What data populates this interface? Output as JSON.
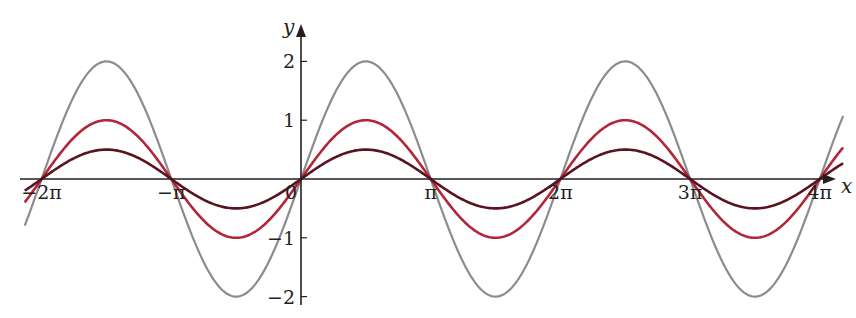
{
  "chart_data": {
    "type": "line",
    "title": "",
    "xlabel": "x",
    "ylabel": "y",
    "xlim_pi": [
      -2.13,
      4.18
    ],
    "ylim": [
      -2.2,
      2.5
    ],
    "grid": false,
    "legend": null,
    "x_ticks": [
      {
        "value_pi": -2,
        "label": "−2π"
      },
      {
        "value_pi": -1,
        "label": "−π"
      },
      {
        "value_pi": 0,
        "label": "0"
      },
      {
        "value_pi": 1,
        "label": "π"
      },
      {
        "value_pi": 2,
        "label": "2π"
      },
      {
        "value_pi": 3,
        "label": "3π"
      },
      {
        "value_pi": 4,
        "label": "4π"
      }
    ],
    "y_ticks": [
      {
        "value": 2,
        "label": "2"
      },
      {
        "value": 1,
        "label": "1"
      },
      {
        "value": -1,
        "label": "−1"
      },
      {
        "value": -2,
        "label": "−2"
      }
    ],
    "series": [
      {
        "name": "y = 2 sin x",
        "amplitude": 2,
        "color": "#8c8c8c",
        "width": 2.2
      },
      {
        "name": "y = sin x",
        "amplitude": 1,
        "color": "#b3263a",
        "width": 2.6
      },
      {
        "name": "y = 0.5 sin x",
        "amplitude": 0.5,
        "color": "#5a1420",
        "width": 2.6
      }
    ],
    "sample_points": {
      "x_pi": [
        -2,
        -1.5,
        -1,
        -0.5,
        0,
        0.5,
        1,
        1.5,
        2,
        2.5,
        3,
        3.5,
        4
      ],
      "y_2sinx": [
        0,
        2,
        0,
        -2,
        0,
        2,
        0,
        -2,
        0,
        2,
        0,
        -2,
        0
      ],
      "y_sinx": [
        0,
        1,
        0,
        -1,
        0,
        1,
        0,
        -1,
        0,
        1,
        0,
        -1,
        0
      ],
      "y_halfsinx": [
        0,
        0.5,
        0,
        -0.5,
        0,
        0.5,
        0,
        -0.5,
        0,
        0.5,
        0,
        -0.5,
        0
      ]
    }
  },
  "layout": {
    "origin_px": [
      301,
      179
    ],
    "px_per_pi": 129.7,
    "px_per_unit": 58.8,
    "x_axis_px": [
      20,
      836
    ],
    "y_axis_px": [
      305,
      24
    ]
  }
}
